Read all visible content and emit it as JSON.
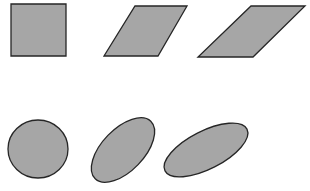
{
  "diagram": {
    "colors": {
      "fill": "#a6a6a6",
      "stroke": "#262626",
      "background": "#ffffff"
    },
    "rows": [
      {
        "name": "polygons",
        "shapes": [
          {
            "type": "square",
            "points": "11,4 66,4 66,56 11,56"
          },
          {
            "type": "parallelogram",
            "points": "135,6 187,6 158,56 104,56"
          },
          {
            "type": "parallelogram",
            "points": "251,6 305,6 253,57 198,57"
          }
        ]
      },
      {
        "name": "ellipses",
        "shapes": [
          {
            "type": "circle",
            "cx": 38,
            "cy": 149,
            "rx": 30,
            "ry": 29,
            "rotate": 0
          },
          {
            "type": "ellipse",
            "cx": 123,
            "cy": 150,
            "rx": 40,
            "ry": 21,
            "rotate": -46
          },
          {
            "type": "ellipse",
            "cx": 206,
            "cy": 150,
            "rx": 46,
            "ry": 19,
            "rotate": -27
          }
        ]
      }
    ]
  }
}
